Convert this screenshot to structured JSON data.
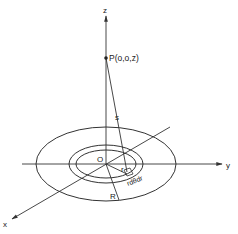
{
  "diagram": {
    "axes": {
      "x_label": "x",
      "y_label": "y",
      "z_label": "z"
    },
    "point_label": "P(o,o,z)",
    "origin_label": "O",
    "distance_label": "s",
    "radius_small_label": "r",
    "element_label": "rdθdr",
    "radius_large_label": "R",
    "colors": {
      "stroke": "#333333",
      "background": "#ffffff"
    }
  }
}
